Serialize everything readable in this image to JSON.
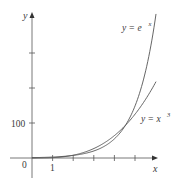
{
  "chart_data": {
    "type": "line",
    "title": "",
    "xlabel": "x",
    "ylabel": "y",
    "x_ticks": [
      1,
      2,
      3,
      4,
      5
    ],
    "x_tick_labels": [
      "1"
    ],
    "y_ticks": [
      100,
      200,
      300
    ],
    "y_tick_labels": [
      "100"
    ],
    "origin_label": "0",
    "xlim": [
      -0.6,
      6.1
    ],
    "ylim": [
      -60,
      415
    ],
    "grid": false,
    "series": [
      {
        "name": "y = e^x",
        "label_base": "y = e",
        "label_sup": "x",
        "x": [
          0,
          1,
          2,
          3,
          4,
          4.5,
          5,
          5.5,
          6
        ],
        "values": [
          1,
          2.7,
          7.4,
          20.1,
          54.6,
          90.0,
          148.4,
          244.7,
          403.4
        ]
      },
      {
        "name": "y = x^3",
        "label_base": "y = x",
        "label_sup": "3",
        "x": [
          0,
          1,
          2,
          3,
          4,
          4.5,
          5,
          5.5,
          6
        ],
        "values": [
          0,
          1,
          8,
          27,
          64,
          91.1,
          125,
          166.4,
          216
        ]
      }
    ]
  },
  "labels": {
    "y_axis": "y",
    "x_axis": "x",
    "origin": "0",
    "tick_1": "1",
    "tick_100": "100",
    "exp_base": "y = e",
    "exp_sup": "x",
    "cube_base": "y = x",
    "cube_sup": "3"
  }
}
